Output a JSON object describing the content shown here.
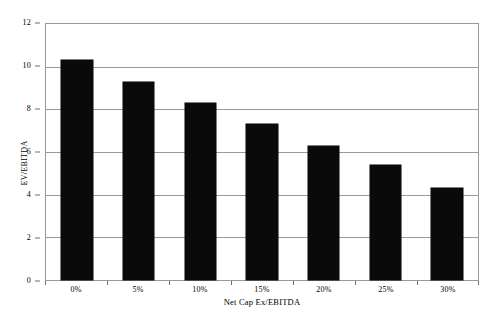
{
  "chart_data": {
    "type": "bar",
    "title": "",
    "categories": [
      "0%",
      "5%",
      "10%",
      "15%",
      "20%",
      "25%",
      "30%"
    ],
    "values": [
      10.3,
      9.3,
      8.3,
      7.3,
      6.3,
      5.4,
      4.3
    ],
    "series": [
      {
        "name": "EV/EBITDA",
        "values": [
          10.3,
          9.3,
          8.3,
          7.3,
          6.3,
          5.4,
          4.3
        ]
      }
    ],
    "xlabel": "Net Cap Ex/EBITDA",
    "ylabel": "EV/EBITDA",
    "ylim": [
      0,
      12
    ],
    "ytick_labels": [
      "0",
      "2",
      "4",
      "6",
      "8",
      "10",
      "12"
    ],
    "ytick_values": [
      0,
      2,
      4,
      6,
      8,
      10,
      12
    ],
    "grid": true,
    "grid_axis": "y",
    "legend": "none",
    "bar_color": "#0a0a0a",
    "grid_color": "#9a9a9a",
    "plot_background": "#ffffff"
  },
  "caption": {
    "text": ""
  }
}
